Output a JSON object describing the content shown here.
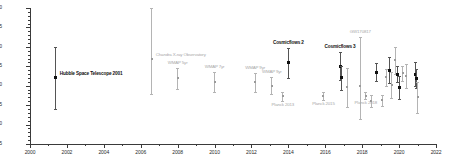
{
  "chart_data": {
    "type": "scatter",
    "title": "",
    "xlabel": "",
    "ylabel": "",
    "xlim": [
      2000,
      2022
    ],
    "ylim": [
      55,
      90
    ],
    "grid": false,
    "legend": "none",
    "xticks": [
      2000,
      2002,
      2004,
      2006,
      2008,
      2010,
      2012,
      2014,
      2016,
      2018,
      2020,
      2022
    ],
    "xticks_minor": [
      2001,
      2003,
      2005,
      2007,
      2009,
      2011,
      2013,
      2015,
      2017,
      2019,
      2021
    ],
    "yticks": [
      55,
      60,
      65,
      70,
      75,
      80,
      85,
      90
    ],
    "yticks_minor": [
      56,
      57,
      58,
      59,
      61,
      62,
      63,
      64,
      66,
      67,
      68,
      69,
      71,
      72,
      73,
      74,
      76,
      77,
      78,
      79,
      81,
      82,
      83,
      84,
      86,
      87,
      88,
      89
    ],
    "colors": {
      "highlight": "#111111",
      "secondary": "#9a9a9a",
      "axis": "#3a3a3a",
      "background": "#ffffff"
    },
    "points": [
      {
        "id": "hubble-space-telescope-2001",
        "x": 2001.4,
        "y": 72.0,
        "err_low": 8.0,
        "err_high": 8.0,
        "style": "dark",
        "label": "Hubble Space Telescope 2001",
        "label_pos": "right"
      },
      {
        "id": "chandra-x-ray-observatory",
        "x": 2006.6,
        "y": 76.9,
        "err_low": 9.0,
        "err_high": 13.0,
        "style": "light",
        "label": "Chandra X-ray Observatory",
        "label_pos": "right"
      },
      {
        "id": "wmap-5yr",
        "x": 2008.0,
        "y": 71.9,
        "err_low": 2.7,
        "err_high": 2.6,
        "style": "light",
        "label": "WMAP 5yr",
        "label_pos": "above"
      },
      {
        "id": "wmap-7yr",
        "x": 2010.0,
        "y": 71.0,
        "err_low": 2.5,
        "err_high": 2.5,
        "style": "light",
        "label": "WMAP 7yr",
        "label_pos": "above"
      },
      {
        "id": "wmap-9yr-a",
        "x": 2012.2,
        "y": 70.9,
        "err_low": 2.5,
        "err_high": 2.4,
        "style": "light",
        "label": "WMAP 9yr",
        "label_pos": "above"
      },
      {
        "id": "wmap-9yr-b",
        "x": 2013.1,
        "y": 70.0,
        "err_low": 2.2,
        "err_high": 2.2,
        "style": "light",
        "label": "WMAP 9yr",
        "label_pos": "above"
      },
      {
        "id": "planck-2013",
        "x": 2013.7,
        "y": 67.3,
        "err_low": 1.2,
        "err_high": 1.2,
        "style": "light",
        "label": "Planck 2013",
        "label_pos": "below"
      },
      {
        "id": "cosmicflows-2",
        "x": 2014.0,
        "y": 75.9,
        "err_low": 4.0,
        "err_high": 3.8,
        "style": "dark",
        "label": "Cosmicflows 2",
        "label_pos": "above"
      },
      {
        "id": "planck-2015",
        "x": 2015.9,
        "y": 67.3,
        "err_low": 1.0,
        "err_high": 1.0,
        "style": "light",
        "label": "Planck 2015",
        "label_pos": "below"
      },
      {
        "id": "cosmicflows-3",
        "x": 2016.8,
        "y": 75.0,
        "err_low": 3.6,
        "err_high": 3.6,
        "style": "dark",
        "label": "Cosmicflows 3",
        "label_pos": "above"
      },
      {
        "id": "point-2016-b",
        "x": 2016.9,
        "y": 72.0,
        "err_low": 3.0,
        "err_high": 3.0,
        "style": "dark",
        "label": "",
        "label_pos": "none"
      },
      {
        "id": "point-2017-a",
        "x": 2017.2,
        "y": 69.6,
        "err_low": 5.2,
        "err_high": 5.0,
        "style": "light",
        "label": "",
        "label_pos": "none"
      },
      {
        "id": "gw170817",
        "x": 2017.9,
        "y": 70.0,
        "err_low": 8.5,
        "err_high": 12.5,
        "style": "light",
        "label": "GW170817",
        "label_pos": "above"
      },
      {
        "id": "planck-2018",
        "x": 2018.2,
        "y": 67.4,
        "err_low": 0.9,
        "err_high": 0.9,
        "style": "light",
        "label": "Planck 2018",
        "label_pos": "below"
      },
      {
        "id": "point-2018-a",
        "x": 2018.5,
        "y": 66.0,
        "err_low": 1.6,
        "err_high": 1.6,
        "style": "light",
        "label": "",
        "label_pos": "none"
      },
      {
        "id": "point-2018-b",
        "x": 2018.8,
        "y": 73.5,
        "err_low": 2.4,
        "err_high": 2.4,
        "style": "dark",
        "label": "",
        "label_pos": "none"
      },
      {
        "id": "point-2018-c",
        "x": 2019.1,
        "y": 66.2,
        "err_low": 1.4,
        "err_high": 1.4,
        "style": "light",
        "label": "",
        "label_pos": "none"
      },
      {
        "id": "point-2019-a",
        "x": 2019.3,
        "y": 72.2,
        "err_low": 2.2,
        "err_high": 2.2,
        "style": "light",
        "label": "",
        "label_pos": "none"
      },
      {
        "id": "point-2019-b",
        "x": 2019.5,
        "y": 74.0,
        "err_low": 3.4,
        "err_high": 3.4,
        "style": "dark",
        "label": "",
        "label_pos": "none"
      },
      {
        "id": "point-2019-c",
        "x": 2019.6,
        "y": 70.2,
        "err_low": 3.4,
        "err_high": 3.4,
        "style": "light",
        "label": "",
        "label_pos": "none"
      },
      {
        "id": "point-2019-d",
        "x": 2019.8,
        "y": 76.5,
        "err_low": 3.6,
        "err_high": 3.4,
        "style": "light",
        "label": "",
        "label_pos": "none"
      },
      {
        "id": "point-2019-e",
        "x": 2019.9,
        "y": 73.0,
        "err_low": 2.0,
        "err_high": 2.0,
        "style": "dark",
        "label": "",
        "label_pos": "none"
      },
      {
        "id": "point-2019-f",
        "x": 2020.0,
        "y": 69.5,
        "err_low": 3.0,
        "err_high": 3.0,
        "style": "dark",
        "label": "",
        "label_pos": "none"
      },
      {
        "id": "point-2020-a",
        "x": 2020.2,
        "y": 73.2,
        "err_low": 2.0,
        "err_high": 2.0,
        "style": "light",
        "label": "",
        "label_pos": "none"
      },
      {
        "id": "point-2020-b",
        "x": 2020.4,
        "y": 72.5,
        "err_low": 3.2,
        "err_high": 3.2,
        "style": "light",
        "label": "",
        "label_pos": "none"
      },
      {
        "id": "point-2020-c",
        "x": 2020.9,
        "y": 73.0,
        "err_low": 3.0,
        "err_high": 3.0,
        "style": "dark",
        "label": "",
        "label_pos": "none"
      },
      {
        "id": "point-2020-d",
        "x": 2020.95,
        "y": 71.8,
        "err_low": 2.4,
        "err_high": 2.4,
        "style": "dark",
        "label": "",
        "label_pos": "none"
      },
      {
        "id": "point-2020-e",
        "x": 2021.0,
        "y": 67.0,
        "err_low": 4.0,
        "err_high": 4.0,
        "style": "light",
        "label": "",
        "label_pos": "none"
      }
    ]
  }
}
